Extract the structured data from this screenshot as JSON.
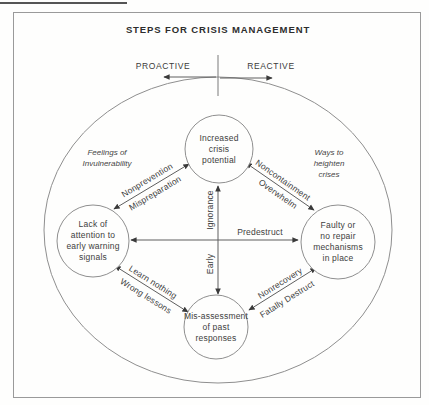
{
  "title": "STEPS FOR CRISIS MANAGEMENT",
  "header": {
    "proactive": "PROACTIVE",
    "reactive": "REACTIVE"
  },
  "nodes": {
    "top": "Increased\ncrisis\npotential",
    "left": "Lack of\nattention to\nearly warning\nsignals",
    "right": "Faulty or\nno repair\nmechanisms\nin place",
    "bottom": "Mis-assessment\nof past\nresponses"
  },
  "side_notes": {
    "left": "Feelings of\nInvulnerability",
    "right": "Ways to\nheighten\ncrises"
  },
  "edge_labels": {
    "top_left": [
      "Nonprevention",
      "Mispreparation"
    ],
    "top_right": [
      "Noncontainment",
      "Overwhelm"
    ],
    "vertical_upper": "Ignorance",
    "vertical_lower": "Early",
    "horizontal": "Predestruct",
    "bottom_left": [
      "Learn nothing",
      "Wrong lessons"
    ],
    "bottom_right": [
      "Nonrecovery",
      "Fatally Destruct"
    ]
  },
  "colors": {
    "ink": "#3a3a3a",
    "line": "#8a8a8a",
    "arrow": "#5f5f5f",
    "background": "#fefefd"
  }
}
